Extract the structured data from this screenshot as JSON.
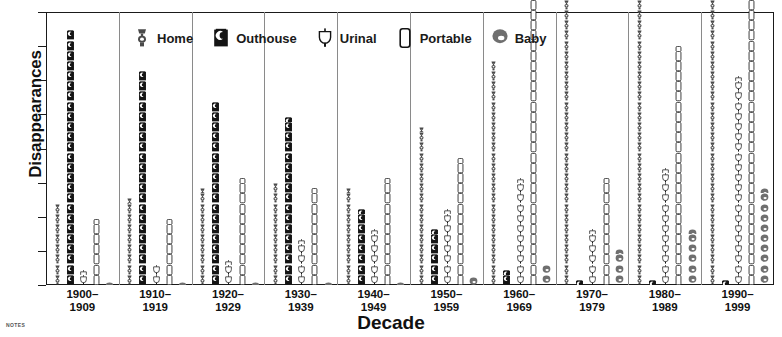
{
  "chart_data": {
    "type": "bar",
    "title": "",
    "xlabel": "Decade",
    "ylabel": "Disappearances",
    "ylim": [
      0,
      400
    ],
    "yticks": [
      0,
      50,
      100,
      150,
      200,
      250,
      300,
      350,
      400
    ],
    "grid": false,
    "legend_position": "top-inside",
    "note": "NOTES",
    "categories": [
      "1900–\n1909",
      "1910–\n1919",
      "1920–\n1929",
      "1930–\n1939",
      "1940–\n1949",
      "1950–\n1959",
      "1960–\n1969",
      "1970–\n1979",
      "1980–\n1989",
      "1990–\n1999"
    ],
    "category_labels": [
      {
        "top": "1900–",
        "bottom": "1909"
      },
      {
        "top": "1910–",
        "bottom": "1919"
      },
      {
        "top": "1920–",
        "bottom": "1929"
      },
      {
        "top": "1930–",
        "bottom": "1939"
      },
      {
        "top": "1940–",
        "bottom": "1949"
      },
      {
        "top": "1950–",
        "bottom": "1959"
      },
      {
        "top": "1960–",
        "bottom": "1969"
      },
      {
        "top": "1970–",
        "bottom": "1979"
      },
      {
        "top": "1980–",
        "bottom": "1989"
      },
      {
        "top": "1990–",
        "bottom": "1999"
      }
    ],
    "series": [
      {
        "name": "Home",
        "icon": "home-toilet-icon",
        "color": "#4a4a4a",
        "values": [
          80,
          85,
          95,
          100,
          95,
          155,
          220,
          320,
          345,
          385
        ]
      },
      {
        "name": "Outhouse",
        "icon": "outhouse-icon",
        "color": "#1a1a1a",
        "values": [
          250,
          210,
          180,
          165,
          75,
          55,
          15,
          5,
          5,
          5
        ]
      },
      {
        "name": "Urinal",
        "icon": "urinal-icon",
        "color": "#ffffff",
        "values": [
          15,
          20,
          25,
          45,
          55,
          75,
          105,
          55,
          115,
          205
        ]
      },
      {
        "name": "Portable",
        "icon": "portable-toilet-icon",
        "color": "#ffffff",
        "values": [
          65,
          65,
          105,
          95,
          105,
          125,
          335,
          105,
          235,
          295
        ]
      },
      {
        "name": "Baby",
        "icon": "baby-potty-icon",
        "color": "#6a6a6a",
        "values": [
          3,
          3,
          3,
          3,
          3,
          8,
          20,
          35,
          55,
          95
        ]
      }
    ]
  },
  "legend": {
    "items": [
      {
        "label": "Home",
        "icon": "home-toilet-icon"
      },
      {
        "label": "Outhouse",
        "icon": "outhouse-icon"
      },
      {
        "label": "Urinal",
        "icon": "urinal-icon"
      },
      {
        "label": "Portable",
        "icon": "portable-toilet-icon"
      },
      {
        "label": "Baby",
        "icon": "baby-potty-icon"
      }
    ]
  },
  "axes": {
    "y_title": "Disappearances",
    "x_title": "Decade"
  },
  "footer": {
    "notes_label": "NOTES"
  }
}
